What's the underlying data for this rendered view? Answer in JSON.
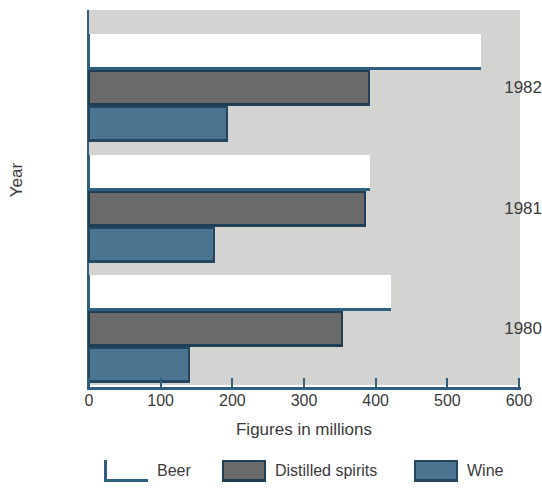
{
  "chart_data": {
    "type": "bar",
    "orientation": "horizontal",
    "title": "",
    "xlabel": "Figures in millions",
    "ylabel": "Year",
    "categories": [
      "1982",
      "1981",
      "1980"
    ],
    "series": [
      {
        "name": "Beer",
        "values": [
          545,
          390,
          420
        ],
        "color": "#ffffff"
      },
      {
        "name": "Distilled spirits",
        "values": [
          390,
          385,
          353
        ],
        "color": "#6a6a6a"
      },
      {
        "name": "Wine",
        "values": [
          193,
          175,
          140
        ],
        "color": "#4a7490"
      }
    ],
    "xlim": [
      0,
      600
    ],
    "xticks": [
      0,
      100,
      200,
      300,
      400,
      500,
      600
    ],
    "xtick_labels": [
      "0",
      "100",
      "200",
      "300",
      "400",
      "500",
      "600"
    ],
    "grid": false,
    "legend_position": "bottom",
    "plot_background": "#d3d3d1",
    "axis_color": "#2e5f7e"
  },
  "axes": {
    "x_title": "Figures in millions",
    "y_title": "Year"
  },
  "legend": {
    "items": [
      {
        "label": "Beer",
        "swatch": "beer-swatch"
      },
      {
        "label": "Distilled spirits",
        "swatch": "distilled-spirits-swatch"
      },
      {
        "label": "Wine",
        "swatch": "wine-swatch"
      }
    ]
  }
}
